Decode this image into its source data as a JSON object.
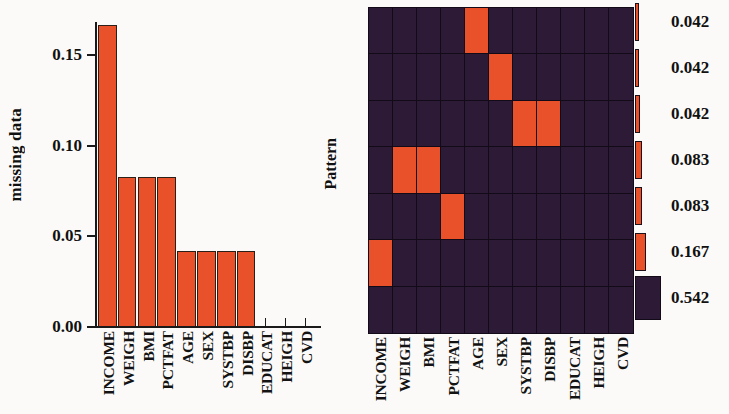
{
  "chart_data": [
    {
      "id": "missing-data-barchart",
      "type": "bar",
      "title": "",
      "xlabel": "",
      "ylabel": "missing data",
      "ylim": [
        0,
        0.175
      ],
      "yticks": [
        "0.00",
        "0.05",
        "0.10",
        "0.15"
      ],
      "ytick_values": [
        0.0,
        0.05,
        0.1,
        0.15
      ],
      "grid": false,
      "legend": "none",
      "bar_color": "#e8512a",
      "categories": [
        "INCOME",
        "WEIGH",
        "BMI",
        "PCTFAT",
        "AGE",
        "SEX",
        "SYSTBP",
        "DISBP",
        "EDUCAT",
        "HEIGH",
        "CVD"
      ],
      "values": [
        0.167,
        0.083,
        0.083,
        0.083,
        0.042,
        0.042,
        0.042,
        0.042,
        0.0,
        0.0,
        0.0
      ]
    },
    {
      "id": "missing-pattern-heatmap",
      "type": "heatmap",
      "title": "",
      "xlabel": "",
      "ylabel": "Pattern",
      "grid": true,
      "legend": "right",
      "on_color": "#e8512a",
      "off_color": "#2c1a36",
      "x_categories": [
        "INCOME",
        "WEIGH",
        "BMI",
        "PCTFAT",
        "AGE",
        "SEX",
        "SYSTBP",
        "DISBP",
        "EDUCAT",
        "HEIGH",
        "CVD"
      ],
      "rows": 7,
      "columns": 11,
      "matrix": [
        [
          0,
          0,
          0,
          0,
          1,
          0,
          0,
          0,
          0,
          0,
          0
        ],
        [
          0,
          0,
          0,
          0,
          0,
          1,
          0,
          0,
          0,
          0,
          0
        ],
        [
          0,
          0,
          0,
          0,
          0,
          0,
          1,
          1,
          0,
          0,
          0
        ],
        [
          0,
          1,
          1,
          0,
          0,
          0,
          0,
          0,
          0,
          0,
          0
        ],
        [
          0,
          0,
          0,
          1,
          0,
          0,
          0,
          0,
          0,
          0,
          0
        ],
        [
          1,
          0,
          0,
          0,
          0,
          0,
          0,
          0,
          0,
          0,
          0
        ],
        [
          0,
          0,
          0,
          0,
          0,
          0,
          0,
          0,
          0,
          0,
          0
        ]
      ],
      "legend_entries": [
        {
          "label": "0.042",
          "value": 0.042,
          "color": "#e8512a",
          "bar_width": 4
        },
        {
          "label": "0.042",
          "value": 0.042,
          "color": "#e8512a",
          "bar_width": 4
        },
        {
          "label": "0.042",
          "value": 0.042,
          "color": "#e8512a",
          "bar_width": 5
        },
        {
          "label": "0.083",
          "value": 0.083,
          "color": "#e8512a",
          "bar_width": 7
        },
        {
          "label": "0.083",
          "value": 0.083,
          "color": "#e8512a",
          "bar_width": 7
        },
        {
          "label": "0.167",
          "value": 0.167,
          "color": "#e8512a",
          "bar_width": 11
        },
        {
          "label": "0.542",
          "value": 0.542,
          "color": "#2c1a36",
          "bar_width": 26
        }
      ]
    }
  ],
  "barchart": {
    "ylabel": "missing data",
    "yticks": [
      "0.00",
      "0.05",
      "0.10",
      "0.15"
    ]
  },
  "heatmap": {
    "ylabel": "Pattern"
  }
}
